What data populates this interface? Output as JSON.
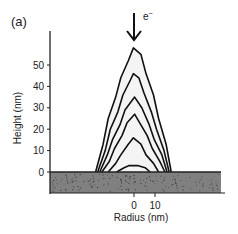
{
  "panel_label": "(a)",
  "beam_label": "e",
  "beam_superscript": "−",
  "chart_data": {
    "type": "line",
    "title": "",
    "panel": "(a)",
    "xlabel": "Radius (nm)",
    "ylabel": "Height (nm)",
    "x_ticks": [
      0,
      10
    ],
    "y_ticks": [
      0,
      10,
      20,
      30,
      40,
      50
    ],
    "xlim": [
      -40,
      42
    ],
    "ylim": [
      -10,
      62
    ],
    "grid": false,
    "legend": null,
    "annotations": [
      {
        "text": "e−",
        "type": "arrow",
        "x": 0,
        "direction": "down",
        "meaning": "electron beam incident at radius 0"
      }
    ],
    "substrate": {
      "from": -10,
      "to": 0,
      "color": "#7a7a7a"
    },
    "series": [
      {
        "name": "contour-1",
        "peak_height": 3,
        "base_halfwidth": 8,
        "x": [
          -8,
          -5,
          -2,
          0,
          2,
          5,
          8
        ],
        "y": [
          0,
          2,
          3,
          3,
          3,
          2,
          0
        ]
      },
      {
        "name": "contour-2",
        "peak_height": 16,
        "base_halfwidth": 12,
        "x": [
          -12,
          -9,
          -6,
          -3,
          0,
          3,
          6,
          9,
          12
        ],
        "y": [
          0,
          4,
          8,
          13,
          16,
          13,
          8,
          4,
          0
        ]
      },
      {
        "name": "contour-3",
        "peak_height": 27,
        "base_halfwidth": 15,
        "x": [
          -15,
          -12,
          -9,
          -6,
          -3,
          0,
          3,
          6,
          9,
          12,
          15
        ],
        "y": [
          0,
          5,
          11,
          17,
          23,
          27,
          23,
          17,
          11,
          5,
          0
        ]
      },
      {
        "name": "contour-4",
        "peak_height": 35,
        "base_halfwidth": 16,
        "x": [
          -16,
          -13,
          -10,
          -7,
          -4,
          0,
          4,
          7,
          10,
          13,
          16
        ],
        "y": [
          0,
          8,
          15,
          22,
          29,
          35,
          30,
          22,
          15,
          8,
          0
        ]
      },
      {
        "name": "contour-5",
        "peak_height": 46,
        "base_halfwidth": 17,
        "x": [
          -17,
          -14,
          -11,
          -8,
          -5,
          -2,
          0,
          2,
          5,
          8,
          11,
          14,
          17
        ],
        "y": [
          0,
          10,
          20,
          28,
          36,
          43,
          46,
          44,
          37,
          28,
          20,
          10,
          0
        ]
      },
      {
        "name": "contour-6",
        "peak_height": 58,
        "base_halfwidth": 18,
        "x": [
          -18,
          -15,
          -12,
          -9,
          -6,
          -3,
          0,
          3,
          6,
          9,
          12,
          15,
          18
        ],
        "y": [
          0,
          13,
          25,
          35,
          44,
          52,
          58,
          55,
          46,
          36,
          25,
          13,
          0
        ]
      }
    ]
  }
}
